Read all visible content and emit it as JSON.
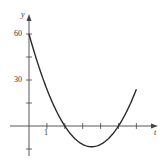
{
  "chart_data": {
    "type": "line",
    "title": "",
    "xlabel": "t",
    "ylabel": "y",
    "x_tick_labels": [
      {
        "value": 1,
        "label": "1"
      }
    ],
    "y_tick_labels": [
      {
        "value": 30,
        "label": "30"
      },
      {
        "value": 60,
        "label": "60"
      }
    ],
    "x_ticks": [
      1,
      2,
      3,
      4,
      5,
      6
    ],
    "y_ticks": [
      -15,
      15,
      30,
      45,
      60
    ],
    "xlim": [
      -1.6,
      7.2
    ],
    "ylim": [
      -30,
      75
    ],
    "grid": false,
    "series": [
      {
        "name": "curve",
        "x": [
          0,
          0.5,
          1,
          1.5,
          2,
          2.5,
          3,
          3.5,
          4,
          4.5,
          5,
          5.5,
          6
        ],
        "values": [
          60,
          40.5,
          24,
          10.5,
          0,
          -7.5,
          -12,
          -13.5,
          -12,
          -7.5,
          0,
          10.5,
          24
        ]
      }
    ],
    "color": "#2a2a2a"
  },
  "labels": {
    "y_axis": "y",
    "x_axis": "t",
    "tick_60": "60",
    "tick_30": "30",
    "tick_1": "1"
  }
}
